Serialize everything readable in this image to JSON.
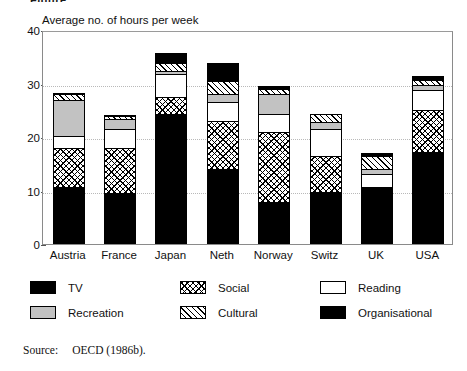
{
  "figure": {
    "top_clipped_text": "Figure",
    "axis_title": "Average no. of hours per week",
    "source_label": "Source:",
    "source_text": "OECD (1986b)."
  },
  "legend": {
    "items": [
      {
        "label": "TV",
        "swatch": "solid-black-swatch",
        "color": "#000000"
      },
      {
        "label": "Social",
        "swatch": "crosshatch-swatch",
        "color": "#ffffff"
      },
      {
        "label": "Reading",
        "swatch": "white-swatch",
        "color": "#ffffff"
      },
      {
        "label": "Recreation",
        "swatch": "gray-swatch",
        "color": "#c2c2c2"
      },
      {
        "label": "Cultural",
        "swatch": "diagonal-hatch-swatch",
        "color": "#ffffff"
      },
      {
        "label": "Organisational",
        "swatch": "solid-black-swatch",
        "color": "#000000"
      }
    ]
  },
  "chart_data": {
    "type": "bar",
    "stacked": true,
    "title": "",
    "xlabel": "",
    "ylabel": "Average no. of hours per week",
    "ylim": [
      0,
      40
    ],
    "yticks": [
      0,
      10,
      20,
      30,
      40
    ],
    "grid": "horizontal-dotted",
    "legend_position": "below",
    "categories": [
      "Austria",
      "France",
      "Japan",
      "Neth",
      "Norway",
      "Switz",
      "UK",
      "USA"
    ],
    "series": [
      {
        "name": "TV",
        "values": [
          10.7,
          9.6,
          24.3,
          14.0,
          7.8,
          9.8,
          10.6,
          17.2
        ]
      },
      {
        "name": "Social",
        "values": [
          7.3,
          8.3,
          3.2,
          9.0,
          13.2,
          6.7,
          0.0,
          7.8
        ]
      },
      {
        "name": "Reading",
        "values": [
          2.1,
          3.6,
          4.3,
          3.5,
          3.3,
          5.0,
          2.4,
          3.7
        ]
      },
      {
        "name": "Recreation",
        "values": [
          6.9,
          1.9,
          0.5,
          1.5,
          3.7,
          1.3,
          1.0,
          1.1
        ]
      },
      {
        "name": "Cultural",
        "values": [
          1.0,
          0.5,
          1.5,
          2.5,
          0.9,
          1.5,
          2.5,
          0.9
        ]
      },
      {
        "name": "Organisational",
        "values": [
          0.3,
          0.3,
          1.9,
          3.3,
          0.6,
          0.0,
          0.5,
          0.8
        ]
      }
    ],
    "totals": [
      28.3,
      24.2,
      35.7,
      33.8,
      29.5,
      24.3,
      17.0,
      31.5
    ]
  }
}
